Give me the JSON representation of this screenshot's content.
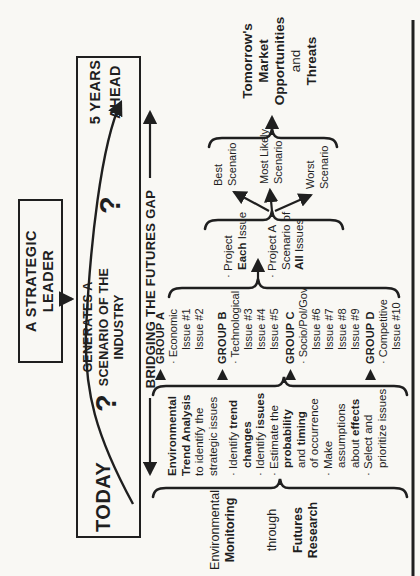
{
  "colors": {
    "paper": "#f9f8f4",
    "ink": "#1f1f1f"
  },
  "leader_box": {
    "line1": "A STRATEGIC",
    "line2": "LEADER"
  },
  "timeline": {
    "today": "TODAY",
    "question_left": "?",
    "generates": [
      "GENERATES A",
      "SCENARIO OF THE",
      "INDUSTRY"
    ],
    "question_right": "?",
    "ahead": [
      "5 YEARS",
      "AHEAD"
    ]
  },
  "gap_label": "BRIDGING THE FUTURES GAP",
  "monitoring": {
    "lines": [
      [
        {
          "t": "Environmental",
          "b": false
        }
      ],
      [
        {
          "t": "Monitoring",
          "b": true
        }
      ],
      [
        {
          "t": "through",
          "b": false
        }
      ],
      [
        {
          "t": "Futures",
          "b": true
        }
      ],
      [
        {
          "t": "Research",
          "b": true
        }
      ]
    ]
  },
  "analysis": {
    "header": [
      [
        {
          "t": "Environmental",
          "b": true
        }
      ],
      [
        {
          "t": "Trend Analysis",
          "b": true
        }
      ],
      [
        {
          "t": "to identify the",
          "b": false
        }
      ],
      [
        {
          "t": "strategic issues",
          "b": false
        }
      ]
    ],
    "bullets": [
      [
        {
          "t": "· Identify ",
          "b": false
        },
        {
          "t": "trend",
          "b": true
        }
      ],
      [
        {
          "t": "changes",
          "b": true
        }
      ],
      [
        {
          "t": "· Identify ",
          "b": false
        },
        {
          "t": "issues",
          "b": true
        }
      ],
      [
        {
          "t": "· Estimate the",
          "b": false
        }
      ],
      [
        {
          "t": "probability",
          "b": true
        }
      ],
      [
        {
          "t": "and ",
          "b": false
        },
        {
          "t": "timing",
          "b": true
        }
      ],
      [
        {
          "t": "of occurrence",
          "b": false
        }
      ],
      [
        {
          "t": "· Make",
          "b": false
        }
      ],
      [
        {
          "t": "assumptions",
          "b": false
        }
      ],
      [
        {
          "t": "about ",
          "b": false
        },
        {
          "t": "effects",
          "b": true
        }
      ],
      [
        {
          "t": "· Select and",
          "b": false
        }
      ],
      [
        {
          "t": "prioritize issues",
          "b": false
        }
      ]
    ]
  },
  "groups": [
    {
      "name": "GROUP A",
      "category": "· Economic",
      "issues": [
        "Issue #1",
        "Issue #2"
      ]
    },
    {
      "name": "GROUP B",
      "category": "· Technological",
      "issues": [
        "Issue #3",
        "Issue #4",
        "Issue #5"
      ]
    },
    {
      "name": "GROUP C",
      "category": "· Socio/Pol/Gov",
      "issues": [
        "Issue #6",
        "Issue #7",
        "Issue #8",
        "Issue #9"
      ]
    },
    {
      "name": "GROUP D",
      "category": "· Competitive",
      "issues": [
        "Issue #10"
      ]
    }
  ],
  "project": {
    "item1": [
      [
        {
          "t": "· Project",
          "b": false
        }
      ],
      [
        {
          "t": "Each",
          "b": true
        },
        {
          "t": " Issue",
          "b": false
        }
      ]
    ],
    "item2": [
      [
        {
          "t": "· Project A",
          "b": false
        }
      ],
      [
        {
          "t": "Scenario of",
          "b": false
        }
      ],
      [
        {
          "t": "All",
          "b": true
        },
        {
          "t": " Issues",
          "b": false
        }
      ]
    ]
  },
  "scenarios": {
    "best": [
      "Best",
      "Scenario"
    ],
    "most_likely": [
      "Most Likely",
      "Scenario"
    ],
    "worst": [
      "Worst",
      "Scenario"
    ]
  },
  "outcome": {
    "lines": [
      [
        {
          "t": "Tomorrow's",
          "b": true
        }
      ],
      [
        {
          "t": "Market",
          "b": true
        }
      ],
      [
        {
          "t": "Opportunities",
          "b": true
        }
      ],
      [
        {
          "t": "and",
          "b": false
        }
      ],
      [
        {
          "t": "Threats",
          "b": true
        }
      ]
    ]
  }
}
